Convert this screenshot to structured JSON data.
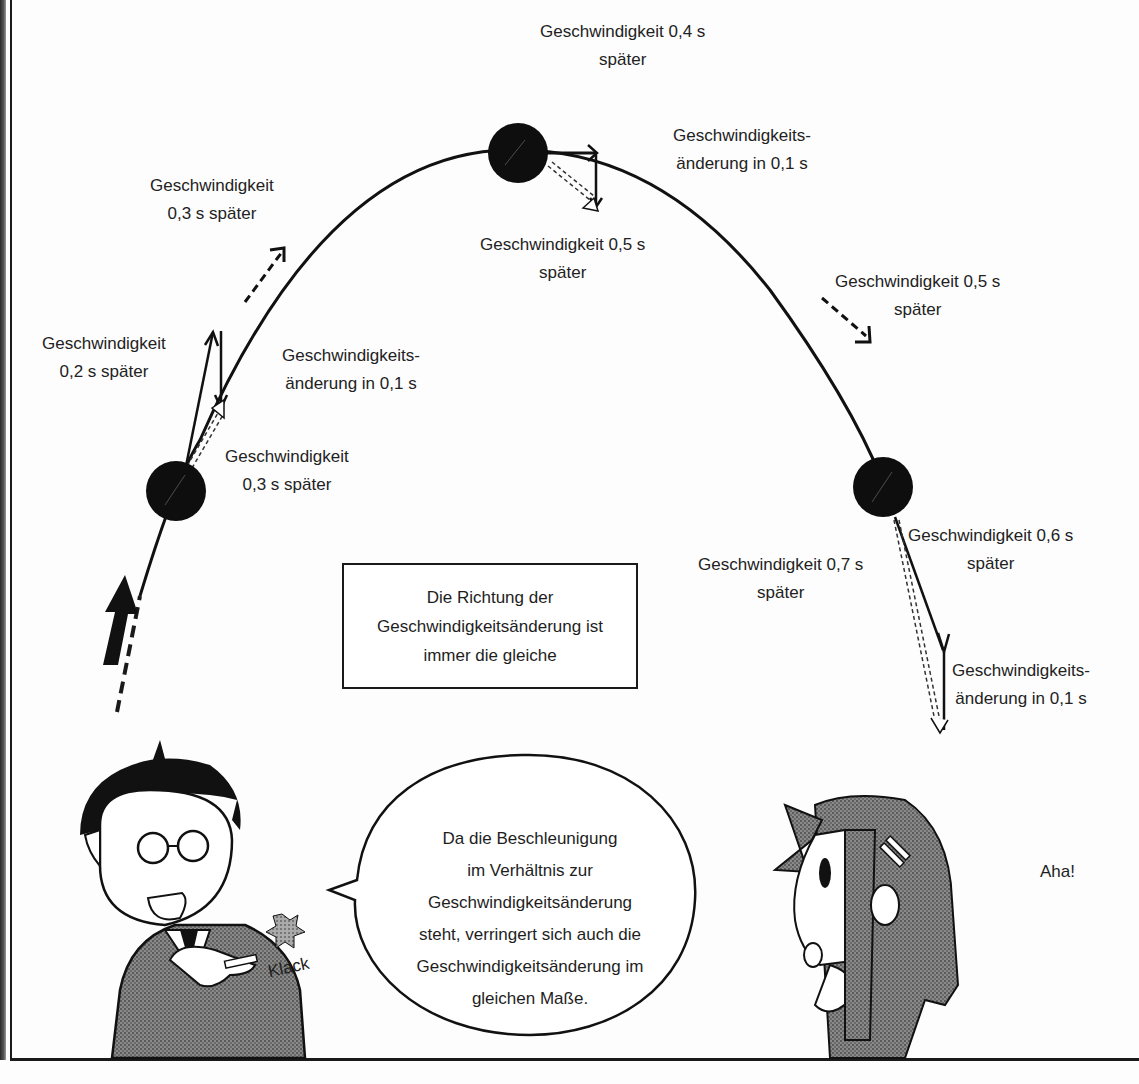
{
  "comic": {
    "diagram": {
      "labels": {
        "v03_top": [
          "Geschwindigkeit",
          "0,3 s später"
        ],
        "v04": [
          "Geschwindigkeit 0,4 s",
          "später"
        ],
        "dv_top": [
          "Geschwindigkeits-",
          "änderung in 0,1 s"
        ],
        "v05_top": [
          "Geschwindigkeit 0,5 s",
          "später"
        ],
        "v02": [
          "Geschwindigkeit",
          "0,2 s später"
        ],
        "dv_left": [
          "Geschwindigkeits-",
          "änderung in 0,1 s"
        ],
        "v03_low": [
          "Geschwindigkeit",
          "0,3 s später"
        ],
        "v05_right": [
          "Geschwindigkeit 0,5 s",
          "später"
        ],
        "v06": [
          "Geschwindigkeit 0,6 s",
          "später"
        ],
        "v07": [
          "Geschwindigkeit 0,7 s",
          "später"
        ],
        "dv_right": [
          "Geschwindigkeits-",
          "änderung in 0,1 s"
        ]
      },
      "caption_box": [
        "Die Richtung der",
        "Geschwindigkeitsänderung ist",
        "immer die gleiche"
      ]
    },
    "speech_bubble": [
      "Da die Beschleunigung",
      "im Verhältnis zur",
      "Geschwindigkeitsänderung",
      "steht, verringert sich auch die",
      "Geschwindigkeitsänderung im",
      "gleichen Maße."
    ],
    "sfx": {
      "klack": "Klack",
      "aha": "Aha!"
    }
  }
}
